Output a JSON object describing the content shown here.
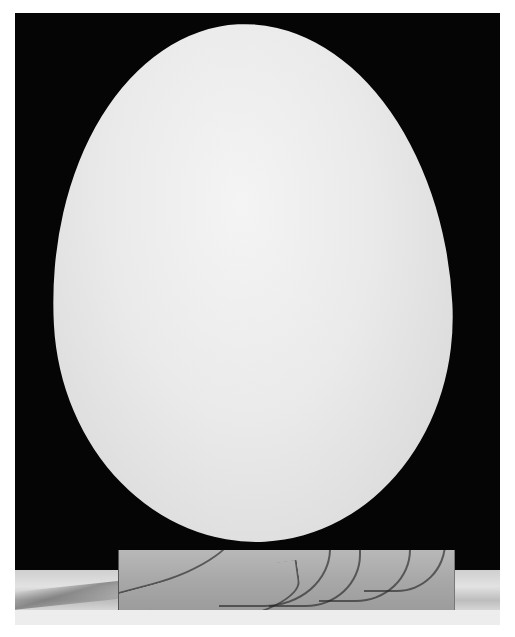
{
  "image": {
    "description": "Black and white photograph of a large white egg resting upright on a small wooden block against a black background",
    "subject": "egg",
    "support": "wooden block",
    "background_color": "#050505",
    "egg_color": "#e8e8e8",
    "block_color": "#a8a8a8",
    "border_color": "#ffffff"
  }
}
